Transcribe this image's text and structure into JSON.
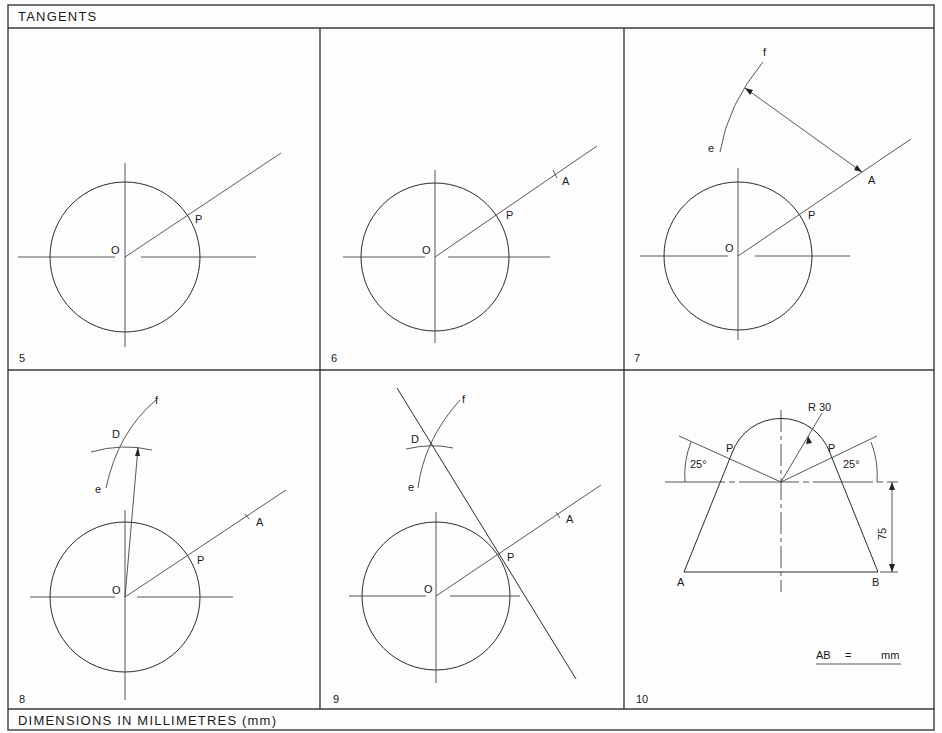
{
  "header": {
    "title": "TANGENTS"
  },
  "footer": {
    "text": "DIMENSIONS IN MILLIMETRES (mm)"
  },
  "panels": [
    {
      "number": "5",
      "labels": {
        "O": "O",
        "P": "P"
      }
    },
    {
      "number": "6",
      "labels": {
        "O": "O",
        "P": "P",
        "A": "A"
      }
    },
    {
      "number": "7",
      "labels": {
        "O": "O",
        "P": "P",
        "A": "A",
        "e": "e",
        "f": "f"
      }
    },
    {
      "number": "8",
      "labels": {
        "O": "O",
        "P": "P",
        "A": "A",
        "D": "D",
        "e": "e",
        "f": "f"
      }
    },
    {
      "number": "9",
      "labels": {
        "O": "O",
        "P": "P",
        "A": "A",
        "D": "D",
        "e": "e",
        "f": "f"
      }
    },
    {
      "number": "10",
      "labels": {
        "radius": "R 30",
        "angle_left": "25°",
        "angle_right": "25°",
        "P_left": "P",
        "P_right": "P",
        "height": "75",
        "A": "A",
        "B": "B"
      },
      "answer": {
        "label": "AB",
        "eq": "=",
        "unit": "mm"
      }
    }
  ]
}
